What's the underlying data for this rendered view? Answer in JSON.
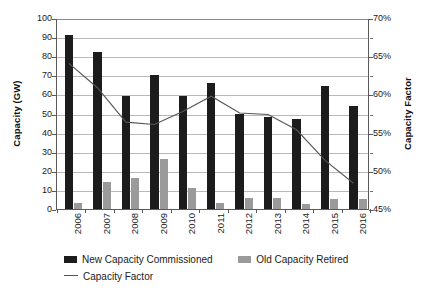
{
  "chart_data": {
    "type": "bar",
    "title": "",
    "xlabel": "",
    "ylabel": "Capacity (GW)",
    "y2label": "Capacity Factor",
    "ylim": [
      0,
      100
    ],
    "y2lim": [
      0.45,
      0.7
    ],
    "ytick_labels": [
      "100",
      "90",
      "80",
      "70",
      "60",
      "50",
      "40",
      "30",
      "20",
      "10",
      "0"
    ],
    "ytick_values": [
      100,
      90,
      80,
      70,
      60,
      50,
      40,
      30,
      20,
      10,
      0
    ],
    "y2tick_labels": [
      "70%",
      "65%",
      "60%",
      "55%",
      "50%",
      "45%"
    ],
    "y2tick_values": [
      70,
      65,
      60,
      55,
      50,
      45
    ],
    "grid": true,
    "legend_position": "bottom-left",
    "categories": [
      "2006",
      "2007",
      "2008",
      "2009",
      "2010",
      "2011",
      "2012",
      "2013",
      "2014",
      "2015",
      "2016"
    ],
    "series": [
      {
        "name": "New Capacity Commissioned",
        "kind": "bar",
        "axis": "left",
        "color": "#1c1c1c",
        "values": [
          91,
          82,
          59,
          70,
          59,
          66,
          50,
          48,
          47,
          64.5,
          54
        ]
      },
      {
        "name": "Old Capacity Retired",
        "kind": "bar",
        "axis": "left",
        "color": "#9a9a9a",
        "values": [
          3,
          14,
          16.5,
          26,
          11,
          3,
          6,
          6,
          2.5,
          5.5,
          5.5
        ]
      },
      {
        "name": "Capacity Factor",
        "kind": "line",
        "axis": "right",
        "color": "#555555",
        "values": [
          64.2,
          61.0,
          56.5,
          56.2,
          57.9,
          59.9,
          57.7,
          57.5,
          55.5,
          51.5,
          48.5
        ]
      }
    ]
  },
  "legend": {
    "new_label": "New Capacity Commissioned",
    "old_label": "Old Capacity Retired",
    "line_label": "Capacity Factor"
  },
  "axes": {
    "left_title": "Capacity (GW)",
    "right_title": "Capacity Factor"
  }
}
